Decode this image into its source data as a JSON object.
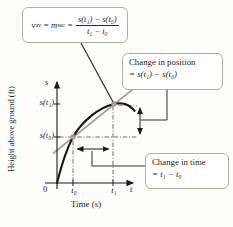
{
  "figure_type": "position-time graph illustrating average velocity as secant slope",
  "colors": {
    "background": "#fdfdfb",
    "curve": "#161616",
    "secant": "#a8a29a",
    "marker_dot": "#a39d94",
    "box_border": "#b3afa7",
    "text": "#1f1f1f",
    "dashed_guide": "#4a4a4a"
  },
  "formula_box": {
    "v": "v",
    "v_sub": "av",
    "eq1": "=",
    "m": "m",
    "m_sub": "sec",
    "eq2": "=",
    "numerator": "s(t₁) − s(t₀)",
    "denominator": "t₁ − t₀"
  },
  "callouts": {
    "position": {
      "line1": "Change in position",
      "line2": "= s(t₁) − s(t₀)"
    },
    "time": {
      "line1": "Change in time",
      "line2": "= t₁ − t₀"
    }
  },
  "graph": {
    "y_var": "s",
    "y_tick_1": "s(t₁)",
    "y_tick_0": "s(t₀)",
    "origin": "0",
    "x_tick_0": "t₀",
    "x_tick_1": "t₁",
    "x_var": "t",
    "x_axis_label": "Time (s)",
    "y_axis_label": "Height above ground (ft)"
  }
}
